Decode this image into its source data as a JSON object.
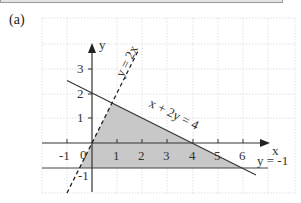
{
  "header": {
    "part_label": "(a)"
  },
  "diagram": {
    "axes": {
      "x_label": "x",
      "y_label": "y",
      "origin_label": "0",
      "x_ticks": [
        "-1",
        "1",
        "2",
        "3",
        "4",
        "5",
        "6"
      ],
      "y_ticks": [
        "3",
        "2",
        "1",
        "-1"
      ]
    },
    "lines": [
      {
        "equation": "y = 2x",
        "style": "dashed"
      },
      {
        "equation": "x + 2y = 4",
        "style": "solid"
      },
      {
        "equation": "y = -1",
        "style": "solid"
      }
    ],
    "shaded_region": {
      "vertices": [
        [
          -0.5,
          -1
        ],
        [
          0.8,
          1.6
        ],
        [
          6,
          -1
        ]
      ],
      "color": "#c8c8c8"
    },
    "grid": true
  }
}
